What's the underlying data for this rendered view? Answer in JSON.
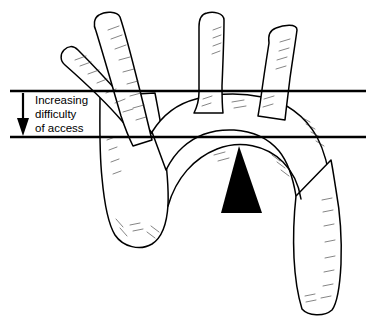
{
  "figure": {
    "background_color": "#ffffff",
    "line_color": "#000000",
    "width": 383,
    "height": 326
  },
  "annotation": {
    "label_lines": [
      "Increasing",
      "difficulty",
      "of access"
    ],
    "arrow_direction": "down",
    "arrow_name": "increasing-difficulty-arrow"
  },
  "reference_lines": [
    {
      "name": "upper-reference-line",
      "y": 91,
      "x_start": 10,
      "x_end": 366
    },
    {
      "name": "lower-reference-line",
      "y": 137,
      "x_start": 10,
      "x_end": 366
    }
  ],
  "pointer": {
    "name": "arch-apex-pointer",
    "shape": "filled-triangle",
    "direction": "up",
    "apex_x": 239,
    "apex_y": 146,
    "base_y": 213,
    "base_left_x": 221,
    "base_right_x": 262,
    "color": "#000000"
  },
  "anatomy": {
    "vessels": [
      {
        "name": "branch-vessel-left-outer",
        "label": ""
      },
      {
        "name": "branch-vessel-left-inner",
        "label": ""
      },
      {
        "name": "branch-vessel-middle",
        "label": ""
      },
      {
        "name": "branch-vessel-right",
        "label": ""
      },
      {
        "name": "ascending-aorta",
        "label": ""
      },
      {
        "name": "aortic-arch",
        "label": ""
      },
      {
        "name": "descending-aorta",
        "label": ""
      }
    ]
  }
}
